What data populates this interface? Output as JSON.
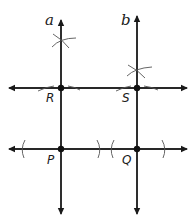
{
  "diagram": {
    "lines": {
      "a": {
        "label": "a",
        "x": 61
      },
      "b": {
        "label": "b",
        "x": 137
      },
      "upper_horizontal": {
        "y": 88
      },
      "lower_horizontal": {
        "y": 149
      }
    },
    "points": {
      "R": {
        "label": "R",
        "x": 61,
        "y": 88
      },
      "S": {
        "label": "S",
        "x": 137,
        "y": 88
      },
      "P": {
        "label": "P",
        "x": 61,
        "y": 149
      },
      "Q": {
        "label": "Q",
        "x": 137,
        "y": 149
      }
    },
    "colors": {
      "line": "#1a1a1a",
      "arc": "#555555",
      "point": "#111111",
      "background": "#ffffff"
    }
  }
}
